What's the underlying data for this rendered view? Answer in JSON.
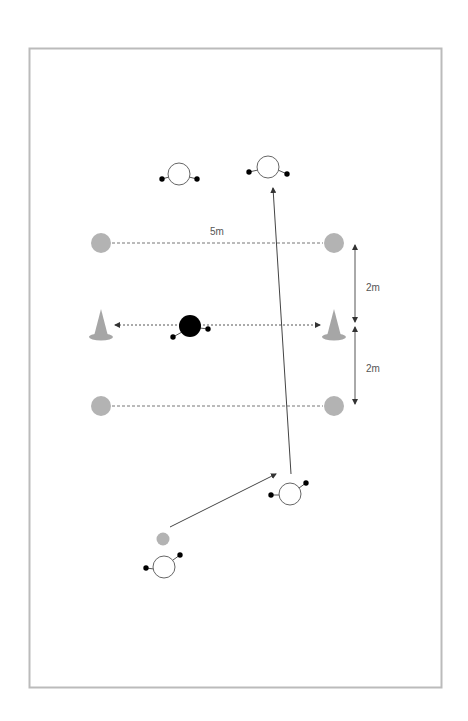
{
  "diagram": {
    "type": "soccer-drill",
    "field": {
      "x": 29,
      "y": 48,
      "width": 412,
      "height": 639,
      "border_color": "#bbbbbb"
    },
    "labels": {
      "width_label": "5m",
      "gap_top_label": "2m",
      "gap_bottom_label": "2m"
    },
    "colors": {
      "marker_gray": "#b3b3b3",
      "cone_gray": "#a6a6a6",
      "line": "#555555",
      "defender": "#000000",
      "player_fill": "#ffffff",
      "player_stroke": "#666666",
      "hand": "#000000",
      "ball_gray": "#b3b3b3"
    },
    "markers": [
      {
        "id": "marker-top-left",
        "x": 101,
        "y": 243
      },
      {
        "id": "marker-top-right",
        "x": 334,
        "y": 243
      },
      {
        "id": "marker-bottom-left",
        "x": 101,
        "y": 406
      },
      {
        "id": "marker-bottom-right",
        "x": 334,
        "y": 406
      }
    ],
    "cones": [
      {
        "id": "cone-left",
        "x": 101,
        "y": 325
      },
      {
        "id": "cone-right",
        "x": 334,
        "y": 325
      }
    ],
    "players": [
      {
        "id": "player-top-left",
        "x": 179,
        "y": 174,
        "hands": [
          [
            162,
            179
          ],
          [
            197,
            179
          ]
        ]
      },
      {
        "id": "player-top-right",
        "x": 268,
        "y": 167,
        "hands": [
          [
            249,
            172
          ],
          [
            287,
            174
          ]
        ]
      },
      {
        "id": "player-middle-right",
        "x": 290,
        "y": 494,
        "hands": [
          [
            271,
            495
          ],
          [
            306,
            483
          ]
        ]
      },
      {
        "id": "player-bottom-left",
        "x": 164,
        "y": 567,
        "hands": [
          [
            146,
            568
          ],
          [
            180,
            555
          ]
        ]
      }
    ],
    "defender": {
      "id": "defender",
      "x": 190,
      "y": 326,
      "hands": [
        [
          173,
          337
        ],
        [
          208,
          329
        ]
      ]
    },
    "ball": {
      "id": "ball",
      "x": 163,
      "y": 539
    },
    "arrows": [
      {
        "id": "pass-arrow",
        "from": [
          170,
          527
        ],
        "to": [
          276,
          474
        ]
      },
      {
        "id": "run-arrow",
        "from": [
          291,
          474
        ],
        "to": [
          273,
          188
        ]
      }
    ]
  }
}
